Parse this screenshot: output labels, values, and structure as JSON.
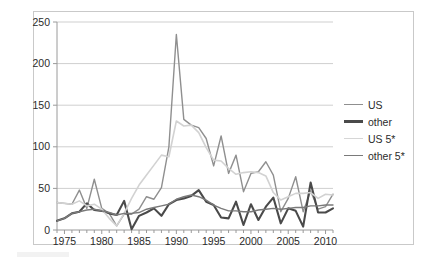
{
  "chart_data": {
    "type": "line",
    "title": "",
    "subtitle": "",
    "xlabel": "",
    "ylabel": "",
    "xlim": [
      1974,
      2011
    ],
    "ylim": [
      0,
      250
    ],
    "ytick_values": [
      0,
      50,
      100,
      150,
      200,
      250
    ],
    "ytick_labels": [
      "0",
      "50",
      "100",
      "150",
      "200",
      "250"
    ],
    "xtick_values": [
      1975,
      1980,
      1985,
      1990,
      1995,
      2000,
      2005,
      2010
    ],
    "xtick_labels": [
      "1975",
      "1980",
      "1985",
      "1990",
      "1995",
      "2000",
      "2005",
      "2010"
    ],
    "minor_xticks": "annual",
    "grid": "horizontal",
    "legend_position": "right",
    "x": [
      1974,
      1975,
      1976,
      1977,
      1978,
      1979,
      1980,
      1981,
      1982,
      1983,
      1984,
      1985,
      1986,
      1987,
      1988,
      1989,
      1990,
      1991,
      1992,
      1993,
      1994,
      1995,
      1996,
      1997,
      1998,
      1999,
      2000,
      2001,
      2002,
      2003,
      2004,
      2005,
      2006,
      2007,
      2008,
      2009,
      2010,
      2011
    ],
    "series": [
      {
        "name": "US",
        "color": "#8f8f8f",
        "width": 1.4,
        "values": [
          33,
          32,
          31,
          48,
          26,
          61,
          26,
          20,
          5,
          19,
          19,
          25,
          40,
          37,
          51,
          100,
          235,
          133,
          126,
          123,
          110,
          77,
          113,
          68,
          90,
          46,
          68,
          70,
          82,
          66,
          22,
          38,
          64,
          22,
          47,
          25,
          28,
          43
        ]
      },
      {
        "name": "other",
        "color": "#4a4a4a",
        "width": 2.1,
        "values": [
          11,
          14,
          20,
          22,
          32,
          24,
          23,
          20,
          18,
          35,
          1,
          17,
          21,
          26,
          17,
          31,
          36,
          38,
          41,
          48,
          34,
          30,
          15,
          14,
          34,
          6,
          31,
          12,
          28,
          39,
          8,
          26,
          23,
          4,
          57,
          21,
          21,
          26
        ]
      },
      {
        "name": "US 5*",
        "color": "#d2d2d2",
        "width": 1.6,
        "values": [
          33,
          32,
          31,
          35,
          29,
          31,
          25,
          14,
          5,
          20,
          38,
          54,
          66,
          78,
          90,
          88,
          131,
          125,
          126,
          117,
          99,
          84,
          83,
          74,
          67,
          69,
          70,
          69,
          65,
          45,
          36,
          40,
          44,
          44,
          45,
          38,
          43,
          42
        ]
      },
      {
        "name": "other 5*",
        "color": "#7a7a7a",
        "width": 1.4,
        "values": [
          11,
          14,
          20,
          22,
          24,
          25,
          23,
          21,
          18,
          20,
          20,
          21,
          25,
          27,
          29,
          31,
          37,
          40,
          42,
          40,
          36,
          30,
          26,
          23,
          23,
          22,
          22,
          24,
          25,
          26,
          25,
          26,
          27,
          27,
          29,
          29,
          30,
          30
        ]
      }
    ]
  },
  "legend": {
    "items": [
      {
        "label": "US",
        "color": "#8f8f8f",
        "width": 1.8
      },
      {
        "label": "other",
        "color": "#4a4a4a",
        "width": 3
      },
      {
        "label": "US 5*",
        "color": "#d6d6d6",
        "width": 1.8
      },
      {
        "label": "other 5*",
        "color": "#7a7a7a",
        "width": 1.8
      }
    ]
  },
  "style": {
    "grid_color": "#cfcfcf",
    "axis_color": "#9a9a9a",
    "border_color": "#c9c9c9",
    "text_color": "#2b2b2b",
    "background": "#ffffff"
  }
}
